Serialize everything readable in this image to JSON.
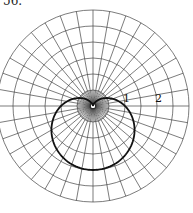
{
  "problem_number": "56.",
  "chart_data": {
    "type": "line",
    "coordinate_system": "polar",
    "title": "",
    "equation_hint": "r = 1 - sin(theta)",
    "curve_shape": "cardioid",
    "r_tick_labels": [
      "1",
      "2"
    ],
    "r_ticks": [
      1,
      2
    ],
    "rlim": [
      0,
      3
    ],
    "ring_step": 0.5,
    "spoke_step_deg_outer": 10,
    "spoke_step_deg_inner": 5,
    "grid": true,
    "series": [
      {
        "name": "curve",
        "theta_deg": [
          0,
          30,
          60,
          90,
          120,
          150,
          180,
          210,
          240,
          270,
          300,
          330,
          360
        ],
        "r": [
          1,
          0.5,
          0.134,
          0,
          0.134,
          0.5,
          1,
          1.5,
          1.866,
          2,
          1.866,
          1.5,
          1
        ]
      }
    ]
  },
  "colors": {
    "grid": "#444444",
    "curve": "#111111",
    "background": "#ffffff"
  }
}
